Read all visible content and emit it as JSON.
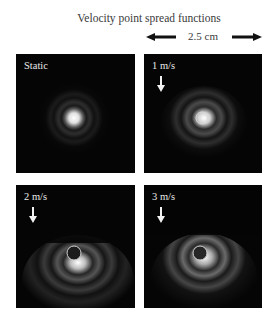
{
  "figure": {
    "title": "Velocity point spread functions",
    "scale_bar": {
      "label": "2.5 cm",
      "left_arrow_icon": "arrow-left-icon",
      "right_arrow_icon": "arrow-right-icon"
    },
    "panels": [
      {
        "id": "static",
        "label": "Static",
        "velocity_arrow": false,
        "position": "top-left"
      },
      {
        "id": "1ms",
        "label": "1 m/s",
        "velocity_arrow": true,
        "position": "top-right"
      },
      {
        "id": "2ms",
        "label": "2 m/s",
        "velocity_arrow": true,
        "position": "bottom-left"
      },
      {
        "id": "3ms",
        "label": "3 m/s",
        "velocity_arrow": true,
        "position": "bottom-right"
      }
    ],
    "colors": {
      "background": "#ffffff",
      "panel": "#050505",
      "text": "#3a3a3a",
      "panel_text": "#e8e8e8"
    }
  }
}
